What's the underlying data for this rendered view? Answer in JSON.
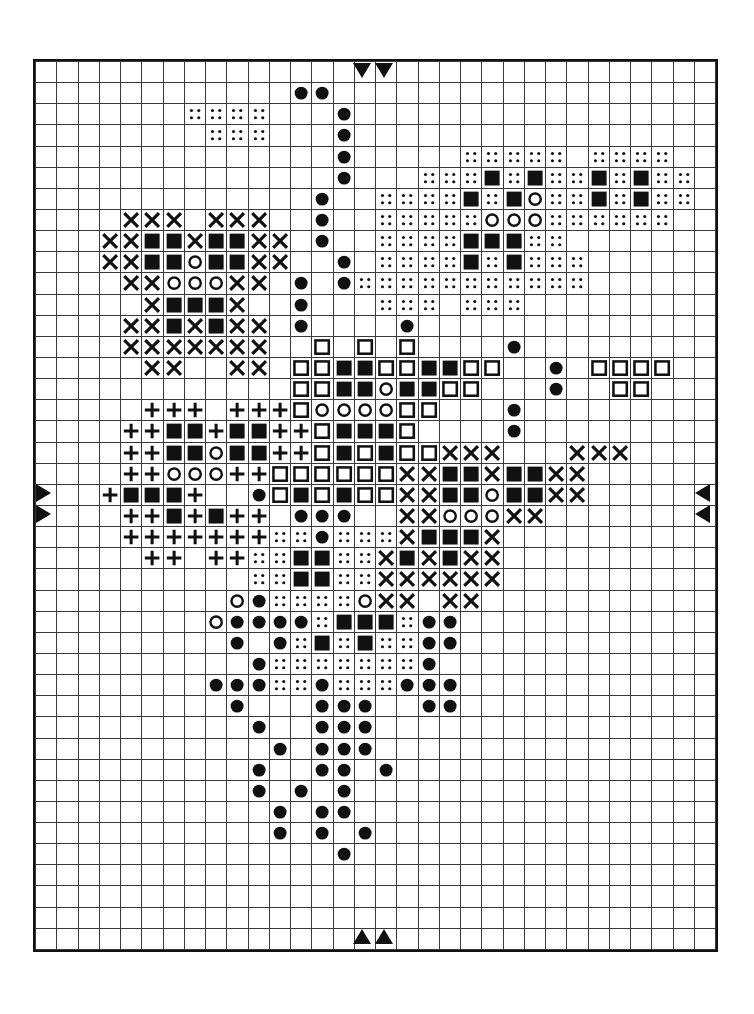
{
  "document": {
    "type": "cross-stitch-pattern-chart",
    "title": "Cross Stitch Pattern Chart",
    "grid": {
      "columns": 32,
      "rows": 42,
      "cell_px": 21.2,
      "line_color": "#3a3a3a",
      "border_color": "#111111",
      "background": "#ffffff"
    },
    "symbol_legend": [
      {
        "key": "X",
        "name": "cross-symbol",
        "description": "X / cross stitch"
      },
      {
        "key": "F",
        "name": "filled-square-symbol",
        "description": "solid filled square"
      },
      {
        "key": "O",
        "name": "open-circle-symbol",
        "description": "open circle outline"
      },
      {
        "key": "C",
        "name": "filled-circle-symbol",
        "description": "solid filled circle"
      },
      {
        "key": "D",
        "name": "dotted-symbol",
        "description": "four dots / stipple"
      },
      {
        "key": "P",
        "name": "plus-symbol",
        "description": "plus / cross bar"
      },
      {
        "key": "S",
        "name": "open-square-symbol",
        "description": "open square outline"
      },
      {
        "key": ".",
        "name": "empty-cell",
        "description": "blank square"
      }
    ],
    "markers": {
      "top": [
        {
          "name": "center-marker-top-left",
          "col": 15,
          "direction": "down"
        },
        {
          "name": "center-marker-top-right",
          "col": 16,
          "direction": "down"
        }
      ],
      "bottom": [
        {
          "name": "center-marker-bottom-left",
          "col": 15,
          "direction": "up"
        },
        {
          "name": "center-marker-bottom-right",
          "col": 16,
          "direction": "up"
        }
      ],
      "left": [
        {
          "name": "center-marker-left-upper",
          "row": 20,
          "direction": "right"
        },
        {
          "name": "center-marker-left-lower",
          "row": 21,
          "direction": "right"
        }
      ],
      "right": [
        {
          "name": "center-marker-right-upper",
          "row": 20,
          "direction": "left"
        },
        {
          "name": "center-marker-right-lower",
          "row": 21,
          "direction": "left"
        }
      ]
    }
  },
  "chart_data": {
    "type": "heatmap",
    "xlabel": "",
    "ylabel": "",
    "legend_position": "none",
    "grid": true,
    "categories": [
      "X",
      "F",
      "O",
      "C",
      "D",
      "P",
      "S",
      "."
    ],
    "cells": [
      "................................",
      "............CC..................",
      ".......DDDD...C.................",
      "........DDD...C.................",
      "..............C.....DDDDD.DDDD..",
      "..............C...DDDFDFDDFDFDD.",
      ".............C..DDDDFDFODDFDFDD.",
      "....XXX.XXX..C..DDDDDOOODDDDDD..",
      "...XXFFXFFXX.C..DDDDFFFDD.......",
      "...XXFFOFFXX..C.DDDDFDFDDD......",
      "....XXOOOXX.C.CDDDDDDDDDDD......",
      ".....XFFFX..C...DDD.DDD.........",
      "....XXFXFXX.C....C..............",
      "....XXXXXXX..S.S.S....C.........",
      ".....XX..XX.SSFFSSFFSS..C.SSSS..",
      "............SSFFOFFSS...C..SS...",
      ".....PPP.PPPSOOOOSS...C.........",
      "....PPFFPFFPPSFFFS....C.........",
      "....PPFFOFFPPSFSFSSXXX...XXX....",
      "....PPOOOPPSSSSSSXXFFXFFXX......",
      "...PFFFP..CSFSFSSXXFFOFFXX......",
      "....PPFPFPP.CCC..XXOOOXX........",
      "....PPPPPPPDDCDDDXFFFX..........",
      ".....PP.PPDDFFDDXFXFXX..........",
      "..........DDFFDDXXXXXX..........",
      ".........OCDDDDOXX.XX...........",
      "........OCCCCDFFFDCC............",
      ".........C.CDFDFDDCC............",
      "..........CDDDDDDDC.............",
      "........CCCDDCDDDCCC............",
      ".........C...CCC..CC............",
      "..........C..CCC................",
      "...........C.CCC................",
      "..........C..CC.C...............",
      "..........C.C.C.................",
      "...........C.CC.................",
      "...........C.C.C................",
      "..............C.................",
      "................................",
      "................................",
      "................................",
      "................................"
    ]
  }
}
